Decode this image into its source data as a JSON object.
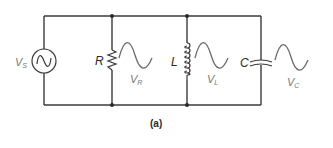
{
  "figure": {
    "caption": "(a)"
  },
  "source": {
    "label": "V",
    "subscript": "S",
    "symbol": "ac-sine"
  },
  "components": [
    {
      "type": "resistor",
      "label": "R",
      "voltage_label": "V",
      "voltage_sub": "R"
    },
    {
      "type": "inductor",
      "label": "L",
      "voltage_label": "V",
      "voltage_sub": "L"
    },
    {
      "type": "capacitor",
      "label": "C",
      "voltage_label": "V",
      "voltage_sub": "C"
    }
  ],
  "colors": {
    "wire": "#3a3a3a",
    "waveform": "#6a6a6a",
    "voltage_label": "#777777"
  }
}
